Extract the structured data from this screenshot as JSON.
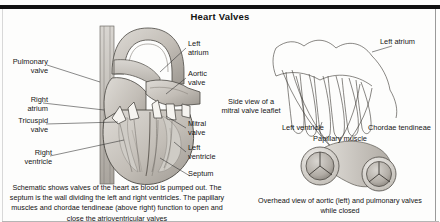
{
  "figure": {
    "title": "Heart Valves",
    "caption_main": "Schematic shows valves of the heart as blood is pumped out. The septum is the wall dividing the left and right ventricles. The papillary muscles and chordae tendineae (above right) function to open and close the atrioventricular valves",
    "caption_right": "Overhead view of aortic (left) and pulmonary valves while closed"
  },
  "labels": {
    "pulmonary_valve": "Pulmonary\nvalve",
    "right_atrium": "Right\natrium",
    "tricuspid_valve": "Tricuspid\nvalve",
    "right_ventricle": "Right\nventricle",
    "left_atrium": "Left\natrium",
    "aortic_valve": "Aortic\nvalve",
    "mitral_valve": "Mitral\nvalve",
    "left_ventricle": "Left\nventricle",
    "septum": "Septum",
    "side_view_note": "Side view of a\nmitral valve leaflet",
    "left_atrium_right": "Left atrium",
    "left_ventricle_right": "Left ventricle",
    "chordae_tendineae": "Chordae tendineae",
    "papillary_muscle": "Papillary muscle"
  },
  "colors": {
    "ink": "#161616",
    "rule": "#111111",
    "tissue_light": "#d7d4cf",
    "tissue_mid": "#b9b5ae",
    "tissue_dark": "#8f8a83",
    "outline": "#4a4742",
    "valve_white": "#f4f2ee",
    "paper": "#fdfdfc"
  }
}
